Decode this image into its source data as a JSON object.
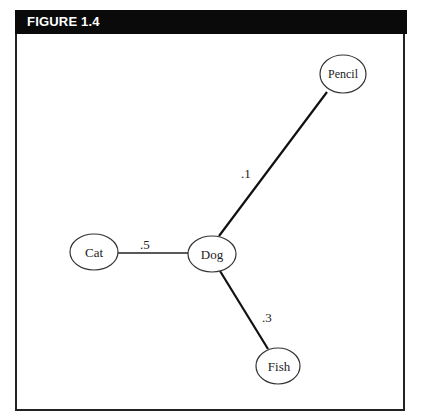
{
  "figure": {
    "title": "FIGURE 1.4"
  },
  "diagram": {
    "nodes": [
      {
        "id": "cat",
        "label": "Cat"
      },
      {
        "id": "dog",
        "label": "Dog"
      },
      {
        "id": "pencil",
        "label": "Pencil"
      },
      {
        "id": "fish",
        "label": "Fish"
      }
    ],
    "edges": [
      {
        "from": "cat",
        "to": "dog",
        "label": ".5"
      },
      {
        "from": "dog",
        "to": "pencil",
        "label": ".1"
      },
      {
        "from": "dog",
        "to": "fish",
        "label": ".3"
      }
    ]
  }
}
